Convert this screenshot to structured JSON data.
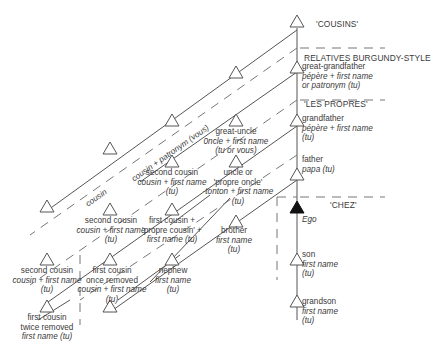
{
  "sections": {
    "cousins": "'COUSINS'",
    "burgundy": "RELATIVES BURGUNDY-STYLE",
    "propres": "'LES PROPRES'",
    "chez": "'CHEZ'"
  },
  "line_labels": {
    "outer": "cousin + patronym (vous)",
    "inner": "cousin"
  },
  "ego": "Ego",
  "lineal": {
    "great_grandfather": {
      "rel": "great-grandfather",
      "term1": "pépère + first name",
      "term2": "or patronym (tu)"
    },
    "grandfather": {
      "rel": "grandfather",
      "term1": "pépère + first name",
      "term2": "(tu)"
    },
    "father": {
      "rel": "father",
      "term1": "papa (tu)"
    },
    "son": {
      "rel": "son",
      "term1": "first name",
      "term2": "(tu)"
    },
    "grandson": {
      "rel": "grandson",
      "term1": "first name",
      "term2": "(tu)"
    }
  },
  "collateral": {
    "great_uncle": {
      "rel": "great-uncle",
      "term1": "0ncle + first name",
      "term2": "(tu or vous)"
    },
    "uncle": {
      "rel1": "uncle or",
      "rel2": "'propre oncle'",
      "term1": "-tonton + first name",
      "term2": "(tu)"
    },
    "brother": {
      "rel": "brother",
      "term1": "first name",
      "term2": "(tu)"
    },
    "nephew": {
      "rel": "nephew",
      "term1": "first name",
      "term2": "(tu)"
    },
    "second_cousin_upper": {
      "rel": "second cousin",
      "term1": "cousin + first name",
      "term2": "(tu)"
    },
    "second_cousin_mid": {
      "rel": "second cousin",
      "term1": "cousin + first name",
      "term2": "(tu)"
    },
    "second_cousin_lower": {
      "rel": "second cousin",
      "term1": "cousin + first name",
      "term2": "(tu)"
    },
    "first_cousin": {
      "rel1": "first cousin +",
      "rel2": "'propre cousin' +",
      "term1": "first name (tu)"
    },
    "first_cousin_once_removed": {
      "rel1": "first cousin",
      "rel2": "once removed",
      "term1": "cousin  + first name",
      "term2": "(tu)"
    },
    "first_cousin_twice_removed": {
      "rel1": "first cousin",
      "rel2": "twice removed",
      "term1": "first name (tu)"
    }
  },
  "colors": {
    "line": "#555555",
    "dash": "#777777",
    "text": "#3a3a3a"
  }
}
